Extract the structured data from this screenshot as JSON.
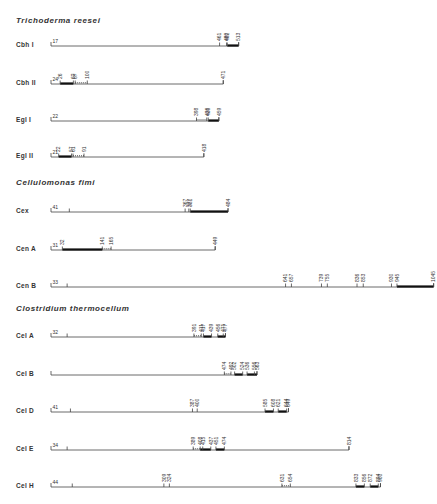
{
  "figure": {
    "scale": {
      "x_start_px": 51,
      "px_per_residue": 0.3665,
      "residue_origin": 1
    },
    "sections": [
      {
        "title": "Trichoderma reesei",
        "title_y": 16,
        "rows": [
          {
            "name": "Cbh I",
            "y": 46,
            "length": 513,
            "start_label": 17,
            "start_pos": 17,
            "ticks": [
              461,
              480,
              482,
              513
            ],
            "tick_labels": [
              "461",
              "480",
              "482",
              "513"
            ],
            "thick": [
              [
                482,
                513
              ]
            ]
          },
          {
            "name": "Cbh II",
            "y": 84,
            "length": 471,
            "start_label": 24,
            "start_pos": 24,
            "ticks": [
              26,
              62,
              67,
              100,
              471
            ],
            "tick_labels": [
              "26",
              "62",
              "67",
              "100",
              "471"
            ],
            "thick": [
              [
                26,
                62
              ]
            ],
            "dots": [
              [
                67,
                100
              ]
            ]
          },
          {
            "name": "Egl I",
            "y": 121,
            "length": 459,
            "start_label": 22,
            "start_pos": 22,
            "ticks": [
              398,
              426,
              430,
              459
            ],
            "tick_labels": [
              "398",
              "426",
              "430",
              "459"
            ],
            "thick": [
              [
                430,
                459
              ]
            ],
            "dots": [
              [
                398,
                426
              ]
            ]
          },
          {
            "name": "Egl II",
            "y": 157,
            "length": 418,
            "start_label": 21,
            "start_pos": 21,
            "ticks": [
              22,
              57,
              61,
              91,
              418
            ],
            "tick_labels": [
              "22",
              "57",
              "61",
              "91",
              "418"
            ],
            "thick": [
              [
                22,
                57
              ]
            ],
            "dots": [
              [
                61,
                91
              ]
            ]
          }
        ]
      },
      {
        "title": "Cellulomonas fimi",
        "title_y": 178,
        "rows": [
          {
            "name": "Cex",
            "y": 212,
            "length": 484,
            "start_label": 41,
            "start_pos": 41,
            "ticks": [
              51,
              367,
              377,
              381,
              484
            ],
            "tick_labels": [
              "",
              "367",
              "377",
              "381",
              "484"
            ],
            "thick": [
              [
                381,
                484
              ]
            ]
          },
          {
            "name": "Cen A",
            "y": 250,
            "length": 449,
            "start_label": 31,
            "start_pos": 31,
            "ticks": [
              32,
              141,
              165,
              449
            ],
            "tick_labels": [
              "32",
              "141",
              "165",
              "449"
            ],
            "thick": [
              [
                32,
                141
              ]
            ],
            "dots": [
              [
                141,
                165
              ]
            ]
          },
          {
            "name": "Cen B",
            "y": 287,
            "length": 1045,
            "start_label": 33,
            "start_pos": 33,
            "ticks": [
              45,
              641,
              657,
              739,
              755,
              836,
              853,
              930,
              945,
              1045
            ],
            "tick_labels": [
              "",
              "641",
              "657",
              "739",
              "755",
              "836",
              "853",
              "930",
              "945",
              "1045"
            ],
            "thick": [
              [
                945,
                1045
              ]
            ]
          }
        ]
      },
      {
        "title": "Clostridium thermocellum",
        "title_y": 304,
        "rows": [
          {
            "name": "Cel A",
            "y": 337,
            "length": 477,
            "start_label": 32,
            "start_pos": 32,
            "ticks": [
              45,
              391,
              411,
              417,
              439,
              456,
              471,
              477
            ],
            "tick_labels": [
              "",
              "391",
              "411",
              "417",
              "439",
              "456",
              "471",
              "477"
            ],
            "thick": [
              [
                417,
                439
              ],
              [
                456,
                477
              ]
            ],
            "dots": [
              [
                391,
                411
              ]
            ]
          },
          {
            "name": "Cel B",
            "y": 375,
            "length": 563,
            "start_label": "",
            "start_pos": 1,
            "ticks": [
              474,
              492,
              502,
              524,
              536,
              556,
              563
            ],
            "tick_labels": [
              "474",
              "492",
              "502",
              "524",
              "536",
              "556",
              "563"
            ],
            "thick": [
              [
                502,
                524
              ],
              [
                536,
                563
              ]
            ],
            "dots": [
              [
                474,
                492
              ]
            ]
          },
          {
            "name": "Cel D",
            "y": 412,
            "length": 649,
            "start_label": 41,
            "start_pos": 41,
            "ticks": [
              54,
              387,
              400,
              585,
              608,
              621,
              644,
              649
            ],
            "tick_labels": [
              "",
              "387",
              "400",
              "585",
              "608",
              "621",
              "644",
              "649"
            ],
            "thick": [
              [
                585,
                608
              ],
              [
                621,
                644
              ]
            ]
          },
          {
            "name": "Cel E",
            "y": 450,
            "length": 814,
            "start_label": 34,
            "start_pos": 34,
            "ticks": [
              45,
              389,
              408,
              415,
              437,
              451,
              474,
              814
            ],
            "tick_labels": [
              "",
              "389",
              "408",
              "415",
              "437",
              "451",
              "474",
              "814"
            ],
            "thick": [
              [
                408,
                437
              ],
              [
                451,
                474
              ]
            ],
            "dots": [
              [
                389,
                408
              ]
            ]
          },
          {
            "name": "Cel H",
            "y": 487,
            "length": 900,
            "start_label": 44,
            "start_pos": 44,
            "ticks": [
              59,
              309,
              324,
              631,
              654,
              833,
              856,
              872,
              894,
              900
            ],
            "tick_labels": [
              "",
              "309",
              "324",
              "631",
              "654",
              "833",
              "856",
              "872",
              "894",
              "900"
            ],
            "thick": [
              [
                833,
                856
              ],
              [
                872,
                894
              ]
            ],
            "dots": [
              [
                631,
                654
              ]
            ]
          }
        ]
      }
    ]
  }
}
